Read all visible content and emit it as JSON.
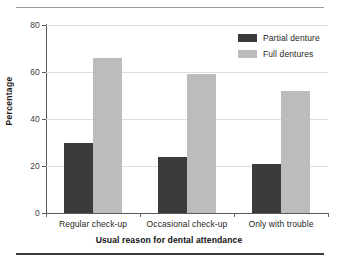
{
  "chart_data": {
    "type": "bar",
    "title": "",
    "subtitle": "",
    "categories": [
      "Regular check-up",
      "Occasional check-up",
      "Only with trouble"
    ],
    "series": [
      {
        "name": "Partial denture",
        "values": [
          30,
          24,
          21
        ],
        "color": "#3b3b3b"
      },
      {
        "name": "Full dentures",
        "values": [
          66,
          59,
          52
        ],
        "color": "#bcbcbc"
      }
    ],
    "xlabel": "Usual reason for dental attendance",
    "ylabel": "Percentage",
    "ylim": [
      0,
      80
    ],
    "yticks": [
      0,
      20,
      40,
      60,
      80
    ],
    "ytick_labels": [
      "0",
      "20",
      "40",
      "60",
      "80"
    ],
    "grid": "horizontal",
    "legend_position": "top-right"
  },
  "axes": {
    "y_label": "Percentage",
    "x_label": "Usual reason for dental attendance"
  },
  "legend": {
    "items": [
      {
        "label": "Partial denture",
        "color": "#3b3b3b"
      },
      {
        "label": "Full dentures",
        "color": "#bcbcbc"
      }
    ]
  },
  "colors": {
    "partial_denture": "#3b3b3b",
    "full_dentures": "#bcbcbc",
    "gridline": "#dededa",
    "axis": "#5a5a5a",
    "rule_top": "#9a9a9a",
    "rule_bottom": "#3a3a3a"
  }
}
